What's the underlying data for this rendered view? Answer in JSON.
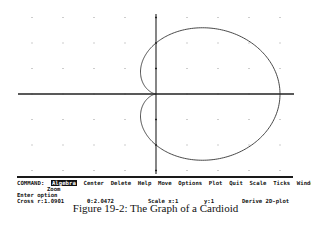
{
  "plot": {
    "origin_px": [
      156,
      94
    ],
    "unit_px": [
      31,
      25.5
    ],
    "grid_cols": [
      -4,
      -3,
      -2,
      -1,
      1,
      2,
      3,
      4
    ],
    "grid_rows": [
      -3,
      -2,
      -1,
      1,
      2,
      3
    ],
    "x_axis_px": [
      18,
      294
    ],
    "y_axis_px": [
      14,
      174
    ],
    "axis_color": "#222222",
    "curve_color": "#333333",
    "grid_dot_color": "#9a9a9a"
  },
  "chart_data": {
    "type": "line",
    "title": "The Graph of a Cardioid",
    "equation": "r = 2(1 + cos θ)",
    "x_range": [
      -4.5,
      4.5
    ],
    "y_range": [
      -3.2,
      3.2
    ],
    "grid": "dots",
    "key_points": {
      "cusp": [
        0,
        0
      ],
      "rightmost": [
        4,
        0
      ],
      "y_intercepts": [
        [
          0,
          2
        ],
        [
          0,
          -2
        ]
      ],
      "leftmost_x": -0.5,
      "max_y": 2.6
    }
  },
  "menu": {
    "prompt": "COMMAND:",
    "items": [
      "Algebra",
      "Center",
      "Delete",
      "Help",
      "Move",
      "Options",
      "Plot",
      "Quit",
      "Scale",
      "Ticks",
      "Window"
    ],
    "selected_index": 0,
    "wrap_item": "Zoom"
  },
  "status": {
    "message": "Enter option",
    "cross_r": "Cross r:1.0901",
    "theta": "θ:2.0472",
    "scale_x": "Scale x:1",
    "scale_y": "y:1",
    "mode": "Derive 2D-plot"
  },
  "caption": "Figure 19-2: The Graph of a Cardioid"
}
